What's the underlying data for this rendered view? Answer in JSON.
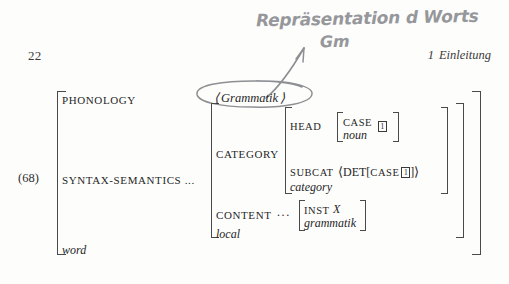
{
  "page": {
    "folio": "22",
    "running_head": {
      "section_number": "1",
      "section_title": "Einleitung"
    },
    "background_color": "#fdfdfc",
    "ink_color": "#262626"
  },
  "handwriting": {
    "color": "#8d8f93",
    "line1": "Repräsentation d Worts",
    "line2": "Gm",
    "arrow": "curved-arrow-pointing-up-right",
    "circled_target": "Grammatik"
  },
  "example": {
    "number": "(68)",
    "structure_type": "attribute-value-matrix"
  },
  "avm": {
    "outer": {
      "attributes": [
        {
          "name": "PHONOLOGY",
          "value": "⟨ Grammatik ⟩"
        },
        {
          "name": "SYNTAX-SEMANTICS ...",
          "value": "local-structure"
        }
      ],
      "type": "word"
    },
    "local": {
      "attributes": [
        {
          "name": "CATEGORY",
          "value": "category-structure"
        },
        {
          "name": "CONTENT",
          "value": "content-structure"
        }
      ],
      "type": "local"
    },
    "category": {
      "attributes": [
        {
          "name": "HEAD",
          "value": "head-structure"
        },
        {
          "name": "SUBCAT",
          "value": "⟨DET[CASE 1]⟩"
        }
      ],
      "type": "category"
    },
    "head": {
      "attributes": [
        {
          "name": "CASE",
          "tag": "1"
        }
      ],
      "type": "noun"
    },
    "content": {
      "ellipsis": "...",
      "attributes": [
        {
          "name": "INST",
          "value": "X"
        }
      ],
      "type": "grammatik"
    },
    "phonology_value": {
      "open_angle": "⟨",
      "word": "Grammatik",
      "close_angle": "⟩"
    },
    "subcat_value": {
      "open_angle": "⟨",
      "head_label": "DET",
      "open_bracket": "[",
      "inner_attr": "CASE",
      "tag": "1",
      "close_bracket": "]",
      "close_angle": "⟩"
    },
    "content_value": {
      "attr": "INST",
      "variable": "X",
      "type": "grammatik"
    }
  }
}
